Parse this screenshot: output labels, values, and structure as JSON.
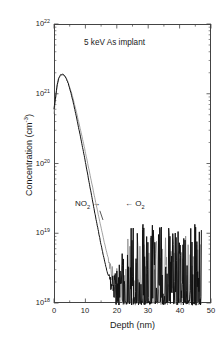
{
  "figure": {
    "title_annotation": "5 keV As implant",
    "xaxis_title": "Depth (nm)",
    "yaxis_title_main": "Concentration (cm",
    "yaxis_title_exp": "-3",
    "yaxis_title_close": ")",
    "background_color": "#ffffff",
    "axis_color": "#444444"
  },
  "annotations": {
    "no2_label": "NO",
    "no2_sub": "2",
    "no2_arrow": "→",
    "o2_arrow": "←",
    "o2_label": "O",
    "o2_sub": "2"
  },
  "axes": {
    "x_ticks": [
      "0",
      "10",
      "20",
      "30",
      "40",
      "50"
    ],
    "x_tick_values": [
      0,
      10,
      20,
      30,
      40,
      50
    ],
    "x_minor_per_major": 2,
    "y_ticks": [
      {
        "mantissa": "10",
        "exponent": "22",
        "value": 1e+22
      },
      {
        "mantissa": "10",
        "exponent": "21",
        "value": 1e+21
      },
      {
        "mantissa": "10",
        "exponent": "20",
        "value": 1e+20
      },
      {
        "mantissa": "10",
        "exponent": "19",
        "value": 1e+19
      },
      {
        "mantissa": "10",
        "exponent": "18",
        "value": 1e+18
      }
    ]
  },
  "chart_data": {
    "type": "line",
    "title": "5 keV As implant",
    "xlabel": "Depth (nm)",
    "ylabel": "Concentration (cm^-3)",
    "xlim": [
      0,
      50
    ],
    "ylim": [
      1e+18,
      1e+22
    ],
    "yscale": "log",
    "xscale": "linear",
    "grid": false,
    "legend": "inline-annotations",
    "series": [
      {
        "name": "NO2",
        "color": "#111111",
        "linewidth": 1.0,
        "annotation": "NO2 →",
        "x": [
          0.0,
          0.5,
          1.0,
          1.5,
          2.0,
          2.5,
          3.0,
          3.5,
          4.0,
          4.5,
          5.0,
          6.0,
          7.0,
          8.0,
          9.0,
          10.0,
          11.0,
          12.0,
          13.0,
          14.0,
          15.0,
          16.0,
          17.0,
          18.0,
          19.0,
          20.0,
          21.0,
          22.0,
          23.0,
          24.0,
          25.0,
          26.0,
          27.0,
          28.0,
          29.0,
          30.0,
          31.0,
          32.0,
          33.0,
          34.0,
          35.0,
          36.0,
          37.0,
          38.0,
          39.0,
          40.0,
          41.0,
          42.0,
          43.0,
          44.0,
          45.0,
          46.0,
          47.0
        ],
        "y": [
          6e+20,
          9e+20,
          1.35e+21,
          1.68e+21,
          1.85e+21,
          1.9e+21,
          1.88e+21,
          1.78e+21,
          1.62e+21,
          1.42e+21,
          1.2e+21,
          8e+20,
          5e+20,
          3e+20,
          1.8e+20,
          1.05e+20,
          6e+19,
          3.4e+19,
          1.95e+19,
          1.15e+19,
          6.8e+18,
          4.2e+18,
          2.7e+18,
          1.85e+18,
          1.35e+18,
          1.1e+18,
          1.02e+18,
          1e+18,
          1e+18,
          1e+18,
          1e+18,
          1e+18,
          1e+18,
          1e+18,
          1e+18,
          1e+18,
          1e+18,
          1e+18,
          1e+18,
          1e+18,
          1e+18,
          1e+18,
          1e+18,
          1e+18,
          1e+18,
          1e+18,
          1e+18,
          1e+18,
          1e+18,
          1e+18,
          1e+18,
          1e+18,
          1e+18
        ]
      },
      {
        "name": "O2",
        "color": "#8a8a8a",
        "linewidth": 0.8,
        "annotation": "← O2",
        "x": [
          0.0,
          0.5,
          1.0,
          1.5,
          2.0,
          2.5,
          3.0,
          3.5,
          4.0,
          4.5,
          5.0,
          6.0,
          7.0,
          8.0,
          9.0,
          10.0,
          11.0,
          12.0,
          13.0,
          14.0,
          15.0,
          16.0,
          17.0,
          18.0,
          19.0,
          20.0,
          21.0,
          22.0,
          23.0,
          24.0,
          25.0,
          26.0,
          27.0,
          28.0,
          29.0,
          30.0,
          32.0,
          34.0,
          36.0,
          38.0,
          40.0,
          42.0,
          44.0,
          46.0,
          47.0
        ],
        "y": [
          5.2e+20,
          8.5e+20,
          1.3e+21,
          1.62e+21,
          1.8e+21,
          1.87e+21,
          1.86e+21,
          1.77e+21,
          1.63e+21,
          1.45e+21,
          1.25e+21,
          8.8e+20,
          5.8e+20,
          3.7e+20,
          2.35e+20,
          1.45e+20,
          8.8e+19,
          5.3e+19,
          3.2e+19,
          1.95e+19,
          1.2e+19,
          7.5e+18,
          4.8e+18,
          3.1e+18,
          2.1e+18,
          1.5e+18,
          1.2e+18,
          1.05e+18,
          1e+18,
          1e+18,
          1e+18,
          1e+18,
          1e+18,
          1e+18,
          1e+18,
          1e+18,
          1e+18,
          1e+18,
          1e+18,
          1e+18,
          1e+18,
          1e+18,
          1e+18,
          1e+18,
          1e+18
        ]
      }
    ],
    "noise_floor": 1e+18,
    "noise_onset_nm": 21
  }
}
